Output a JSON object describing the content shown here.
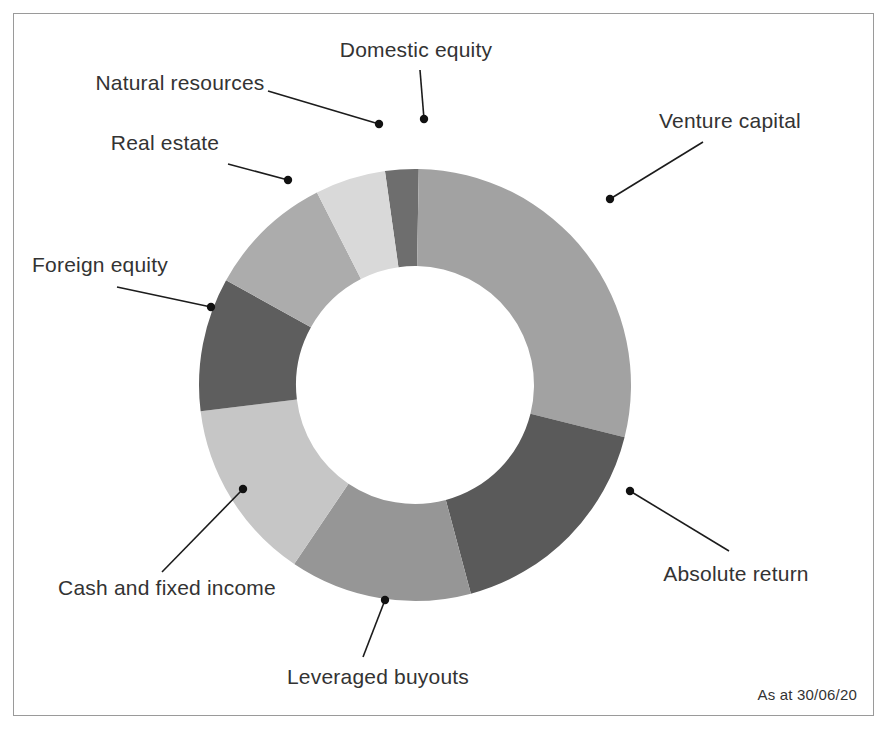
{
  "figure": {
    "footnote": "As at 30/06/20",
    "background_color": "#ffffff",
    "border_color": "#9a9a9a",
    "label_color": "#333333",
    "leader_color": "#1c1c1c"
  },
  "chart_data": {
    "type": "pie",
    "variant": "donut",
    "title": "",
    "subtitle": "",
    "xlabel": "",
    "ylabel": "",
    "legend_position": "none",
    "labels_position": "outside-with-leader-lines",
    "grid": false,
    "annotations": [
      "As at 30/06/20"
    ],
    "center": {
      "x": 415,
      "y": 385
    },
    "outer_radius": 216,
    "inner_radius": 119,
    "start_angle_deg": -8,
    "direction": "clockwise",
    "categories": [
      "Domestic equity",
      "Venture capital",
      "Absolute return",
      "Leveraged buyouts",
      "Cash and fixed income",
      "Foreign equity",
      "Real estate",
      "Natural resources"
    ],
    "values": [
      2.5,
      28.5,
      17.0,
      13.5,
      13.5,
      10.0,
      9.5,
      5.5
    ],
    "unit": "percent",
    "colors": [
      "#6e6e6e",
      "#a2a2a2",
      "#5a5a5a",
      "#969696",
      "#c6c6c6",
      "#5e5e5e",
      "#acacac",
      "#d9d9d9"
    ],
    "slices": [
      {
        "label": "Domestic equity",
        "value": 2.5,
        "color": "#6e6e6e",
        "start_deg": -8,
        "end_deg": 1,
        "label_x": 416,
        "label_y": 57,
        "label_anchor": "middle",
        "dot_x": 424,
        "dot_y": 119,
        "elbow_x": 420,
        "elbow_y": 70
      },
      {
        "label": "Venture capital",
        "value": 28.5,
        "color": "#a2a2a2",
        "start_deg": 1,
        "end_deg": 104,
        "label_x": 730,
        "label_y": 128,
        "label_anchor": "middle",
        "dot_x": 610,
        "dot_y": 199,
        "elbow_x": 703,
        "elbow_y": 142
      },
      {
        "label": "Absolute return",
        "value": 17.0,
        "color": "#5a5a5a",
        "start_deg": 104,
        "end_deg": 165,
        "label_x": 736,
        "label_y": 581,
        "label_anchor": "middle",
        "dot_x": 630,
        "dot_y": 491,
        "elbow_x": 729,
        "elbow_y": 551
      },
      {
        "label": "Leveraged buyouts",
        "value": 13.5,
        "color": "#969696",
        "start_deg": 165,
        "end_deg": 214,
        "label_x": 378,
        "label_y": 684,
        "label_anchor": "middle",
        "dot_x": 385,
        "dot_y": 600,
        "elbow_x": 363,
        "elbow_y": 657
      },
      {
        "label": "Cash and fixed income",
        "value": 13.5,
        "color": "#c6c6c6",
        "start_deg": 214,
        "end_deg": 263,
        "label_x": 167,
        "label_y": 595,
        "label_anchor": "middle",
        "dot_x": 243,
        "dot_y": 489,
        "elbow_x": 162,
        "elbow_y": 572
      },
      {
        "label": "Foreign equity",
        "value": 10.0,
        "color": "#5e5e5e",
        "start_deg": 263,
        "end_deg": 299,
        "label_x": 100,
        "label_y": 272,
        "label_anchor": "middle",
        "dot_x": 211,
        "dot_y": 307,
        "elbow_x": 117,
        "elbow_y": 287
      },
      {
        "label": "Real estate",
        "value": 9.5,
        "color": "#acacac",
        "start_deg": 299,
        "end_deg": 333,
        "label_x": 165,
        "label_y": 150,
        "label_anchor": "middle",
        "dot_x": 288,
        "dot_y": 180,
        "elbow_x": 228,
        "elbow_y": 164
      },
      {
        "label": "Natural resources",
        "value": 5.5,
        "color": "#d9d9d9",
        "start_deg": 333,
        "end_deg": 352,
        "label_x": 180,
        "label_y": 90,
        "label_anchor": "middle",
        "dot_x": 379,
        "dot_y": 124,
        "elbow_x": 268,
        "elbow_y": 91
      }
    ]
  }
}
